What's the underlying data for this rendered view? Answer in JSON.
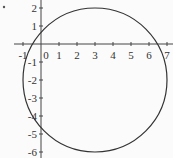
{
  "diagram": {
    "type": "circle-plot",
    "circle": {
      "center": [
        3,
        -2
      ],
      "radius": 4,
      "stroke": "#333333"
    },
    "x_ticks": [
      "-1",
      "0",
      "1",
      "2",
      "3",
      "4",
      "5",
      "6",
      "7"
    ],
    "y_ticks": [
      "2",
      "1",
      "-1",
      "-2",
      "-3",
      "-4",
      "-5",
      "-6"
    ],
    "origin_label": "0",
    "axis_color": "#444444"
  }
}
